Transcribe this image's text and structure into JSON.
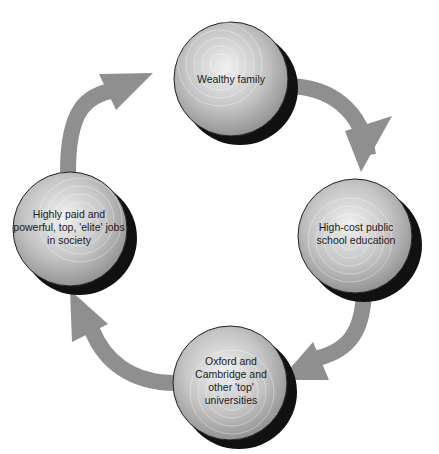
{
  "diagram": {
    "type": "cycle",
    "direction": "clockwise",
    "colors": {
      "arrow": "#8f8f8f",
      "shadow": "#111111",
      "sphere_light": "#e6e6e6",
      "sphere_dark": "#8a8a8a",
      "text": "#1a1a1a"
    },
    "nodes": [
      {
        "id": "top",
        "label": "Wealthy family",
        "cx": 231,
        "cy": 79
      },
      {
        "id": "right",
        "label": "High-cost public school education",
        "cx": 355,
        "cy": 236
      },
      {
        "id": "bottom",
        "label": "Oxford and Cambridge and other 'top' universities",
        "cx": 230,
        "cy": 383
      },
      {
        "id": "left",
        "label": "Highly paid and powerful, top, 'elite' jobs in society",
        "cx": 70,
        "cy": 229
      }
    ],
    "edges": [
      {
        "from": "top",
        "to": "right"
      },
      {
        "from": "right",
        "to": "bottom"
      },
      {
        "from": "bottom",
        "to": "left"
      },
      {
        "from": "left",
        "to": "top"
      }
    ]
  }
}
